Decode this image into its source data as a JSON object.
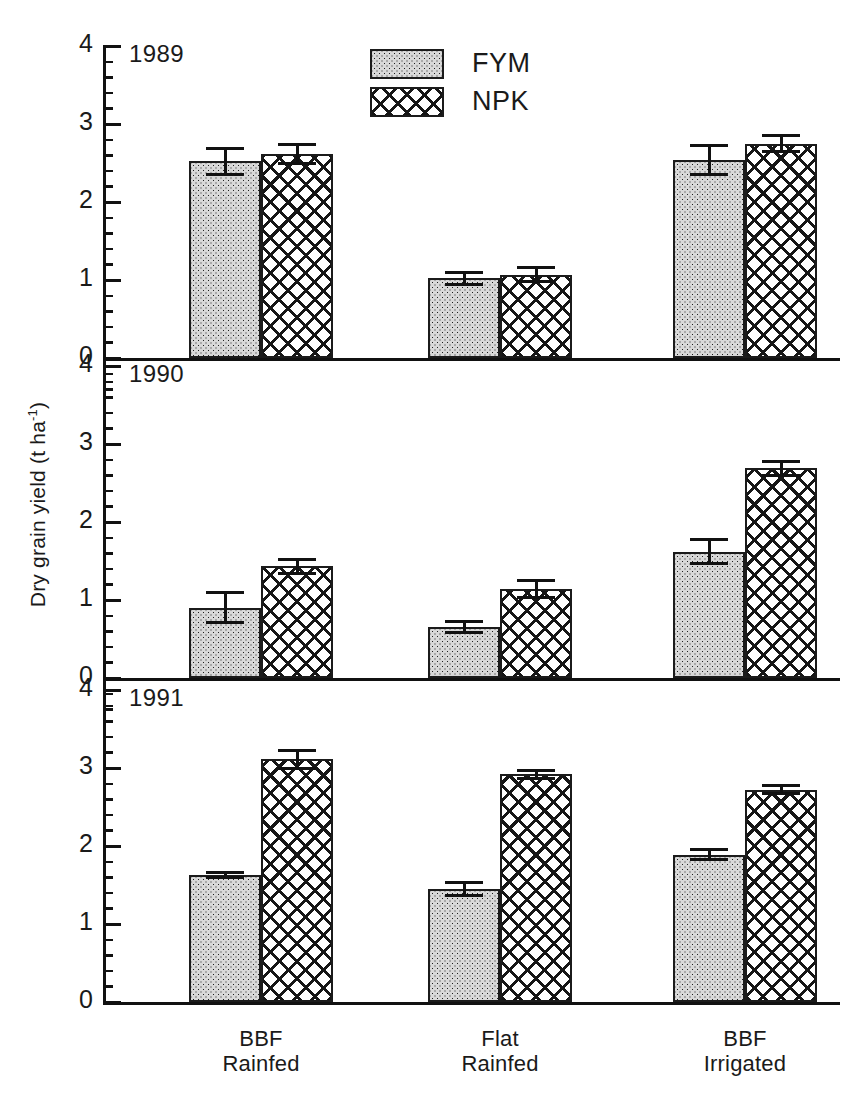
{
  "chart_data": {
    "type": "bar",
    "title": "",
    "subtitle": "",
    "xlabel": "",
    "ylabel": "Dry grain yield (t ha",
    "ylabel_exponent": "-1",
    "ylabel_close": ")",
    "ylim": [
      0,
      4
    ],
    "ytick_labels": [
      "0",
      "1",
      "2",
      "3",
      "4"
    ],
    "ytick_values": [
      0,
      1,
      2,
      3,
      4
    ],
    "minor_tick_step": 0.2,
    "grid": false,
    "legend_position": "top-center",
    "categories": [
      "BBF Rainfed",
      "Flat Rainfed",
      "BBF Irrigated"
    ],
    "category_lines": [
      [
        "BBF",
        "Rainfed"
      ],
      [
        "Flat",
        "Rainfed"
      ],
      [
        "BBF",
        "Irrigated"
      ]
    ],
    "legend": [
      {
        "name": "FYM",
        "pattern": "stipple-dots"
      },
      {
        "name": "NPK",
        "pattern": "crosshatch"
      }
    ],
    "panels": [
      {
        "year": "1989",
        "series": [
          {
            "name": "FYM",
            "values": [
              2.52,
              1.02,
              2.54
            ],
            "errors": [
              0.19,
              0.1,
              0.21
            ]
          },
          {
            "name": "NPK",
            "values": [
              2.62,
              1.07,
              2.75
            ],
            "errors": [
              0.14,
              0.11,
              0.12
            ]
          }
        ]
      },
      {
        "year": "1990",
        "series": [
          {
            "name": "FYM",
            "values": [
              0.9,
              0.66,
              1.62
            ],
            "errors": [
              0.21,
              0.09,
              0.17
            ]
          },
          {
            "name": "NPK",
            "values": [
              1.43,
              1.14,
              2.69
            ],
            "errors": [
              0.11,
              0.13,
              0.11
            ]
          }
        ]
      },
      {
        "year": "1991",
        "series": [
          {
            "name": "FYM",
            "values": [
              1.63,
              1.45,
              1.89
            ],
            "errors": [
              0.05,
              0.1,
              0.08
            ]
          },
          {
            "name": "NPK",
            "values": [
              3.11,
              2.92,
              2.72
            ],
            "errors": [
              0.13,
              0.07,
              0.07
            ]
          }
        ]
      }
    ]
  },
  "colors": {
    "ink": "#111111",
    "fym_fill": "#d8d8d8",
    "npk_fill": "#ffffff",
    "background": "#ffffff"
  }
}
